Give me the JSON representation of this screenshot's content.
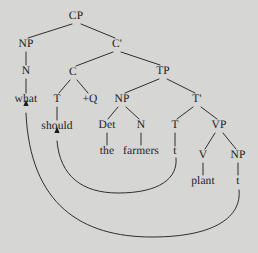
{
  "figure": {
    "type": "syntax-tree",
    "sentence": "what should the farmers plant t",
    "background_color": "#d6d6d4",
    "ink_color": "#1b1b1b",
    "width": 258,
    "height": 253
  },
  "nodes": [
    {
      "id": "cp",
      "label": "CP",
      "kind": "category",
      "x": 76,
      "y": 17
    },
    {
      "id": "np1",
      "label": "NP",
      "kind": "category",
      "x": 26,
      "y": 45
    },
    {
      "id": "cbar",
      "label": "C'",
      "kind": "category",
      "x": 117,
      "y": 45
    },
    {
      "id": "n1",
      "label": "N",
      "kind": "category",
      "x": 26,
      "y": 72
    },
    {
      "id": "c",
      "label": "C",
      "kind": "category",
      "x": 73,
      "y": 73
    },
    {
      "id": "tp",
      "label": "TP",
      "kind": "category",
      "x": 163,
      "y": 72
    },
    {
      "id": "what",
      "label": "what",
      "kind": "leaf",
      "x": 26,
      "y": 100
    },
    {
      "id": "t1",
      "label": "T",
      "kind": "category",
      "x": 57,
      "y": 100
    },
    {
      "id": "q",
      "label": "+Q",
      "kind": "category",
      "x": 90,
      "y": 100
    },
    {
      "id": "np2",
      "label": "NP",
      "kind": "category",
      "x": 122,
      "y": 100
    },
    {
      "id": "tbar",
      "label": "T'",
      "kind": "category",
      "x": 197,
      "y": 100
    },
    {
      "id": "should",
      "label": "should",
      "kind": "leaf",
      "x": 57,
      "y": 127
    },
    {
      "id": "det",
      "label": "Det",
      "kind": "category",
      "x": 107,
      "y": 126
    },
    {
      "id": "n2",
      "label": "N",
      "kind": "category",
      "x": 141,
      "y": 126
    },
    {
      "id": "t2",
      "label": "T",
      "kind": "category",
      "x": 175,
      "y": 126
    },
    {
      "id": "vp",
      "label": "VP",
      "kind": "category",
      "x": 219,
      "y": 126
    },
    {
      "id": "the",
      "label": "the",
      "kind": "leaf",
      "x": 107,
      "y": 152
    },
    {
      "id": "farmers",
      "label": "farmers",
      "kind": "leaf",
      "x": 141,
      "y": 152
    },
    {
      "id": "trace_t",
      "label": "t",
      "kind": "leaf",
      "x": 175,
      "y": 152
    },
    {
      "id": "v",
      "label": "V",
      "kind": "category",
      "x": 203,
      "y": 156
    },
    {
      "id": "np3",
      "label": "NP",
      "kind": "category",
      "x": 238,
      "y": 156
    },
    {
      "id": "plant",
      "label": "plant",
      "kind": "leaf",
      "x": 203,
      "y": 182
    },
    {
      "id": "trace_np",
      "label": "t",
      "kind": "leaf",
      "x": 238,
      "y": 182
    }
  ],
  "branches": [
    {
      "from": "cp",
      "to": "np1",
      "x1": 72,
      "y1": 24,
      "x2": 28,
      "y2": 38
    },
    {
      "from": "cp",
      "to": "cbar",
      "x1": 81,
      "y1": 24,
      "x2": 115,
      "y2": 38
    },
    {
      "from": "np1",
      "to": "n1",
      "x1": 26,
      "y1": 52,
      "x2": 26,
      "y2": 65
    },
    {
      "from": "n1",
      "to": "what",
      "x1": 26,
      "y1": 79,
      "x2": 26,
      "y2": 93
    },
    {
      "from": "cbar",
      "to": "c",
      "x1": 113,
      "y1": 52,
      "x2": 76,
      "y2": 66
    },
    {
      "from": "cbar",
      "to": "tp",
      "x1": 121,
      "y1": 52,
      "x2": 160,
      "y2": 65
    },
    {
      "from": "c",
      "to": "t1",
      "x1": 70,
      "y1": 80,
      "x2": 59,
      "y2": 93
    },
    {
      "from": "c",
      "to": "q",
      "x1": 77,
      "y1": 80,
      "x2": 88,
      "y2": 93
    },
    {
      "from": "t1",
      "to": "should",
      "x1": 57,
      "y1": 107,
      "x2": 57,
      "y2": 120
    },
    {
      "from": "tp",
      "to": "np2",
      "x1": 159,
      "y1": 79,
      "x2": 125,
      "y2": 93
    },
    {
      "from": "tp",
      "to": "tbar",
      "x1": 167,
      "y1": 79,
      "x2": 195,
      "y2": 93
    },
    {
      "from": "np2",
      "to": "det",
      "x1": 118,
      "y1": 107,
      "x2": 108,
      "y2": 119
    },
    {
      "from": "np2",
      "to": "n2",
      "x1": 126,
      "y1": 107,
      "x2": 139,
      "y2": 119
    },
    {
      "from": "det",
      "to": "the",
      "x1": 107,
      "y1": 133,
      "x2": 107,
      "y2": 145
    },
    {
      "from": "n2",
      "to": "farmers",
      "x1": 141,
      "y1": 133,
      "x2": 141,
      "y2": 145
    },
    {
      "from": "tbar",
      "to": "t2",
      "x1": 193,
      "y1": 107,
      "x2": 177,
      "y2": 119
    },
    {
      "from": "tbar",
      "to": "vp",
      "x1": 201,
      "y1": 107,
      "x2": 217,
      "y2": 119
    },
    {
      "from": "t2",
      "to": "trace_t",
      "x1": 175,
      "y1": 133,
      "x2": 175,
      "y2": 146
    },
    {
      "from": "vp",
      "to": "v",
      "x1": 215,
      "y1": 133,
      "x2": 205,
      "y2": 149
    },
    {
      "from": "vp",
      "to": "np3",
      "x1": 223,
      "y1": 133,
      "x2": 236,
      "y2": 149
    },
    {
      "from": "v",
      "to": "plant",
      "x1": 203,
      "y1": 163,
      "x2": 203,
      "y2": 175
    },
    {
      "from": "np3",
      "to": "trace_np",
      "x1": 238,
      "y1": 163,
      "x2": 238,
      "y2": 175
    }
  ],
  "movements": [
    {
      "id": "t-to-c",
      "label": "head-movement-t-to-c",
      "source": "trace_t",
      "target": "should",
      "path": "M 176 158 C 178 178, 160 193, 118 193 C 82 193, 60 176, 57 141"
    },
    {
      "id": "np-to-spec-cp",
      "label": "wh-movement-np-to-spec-cp",
      "source": "trace_np",
      "target": "what",
      "path": "M 239 190 C 242 216, 216 237, 152 237 C 82 237, 30 205, 26 113"
    }
  ],
  "arrowheads": [
    {
      "id": "arrow-should",
      "points_to": "should",
      "x": 57,
      "y": 133
    },
    {
      "id": "arrow-what",
      "points_to": "what",
      "x": 26,
      "y": 106
    }
  ]
}
